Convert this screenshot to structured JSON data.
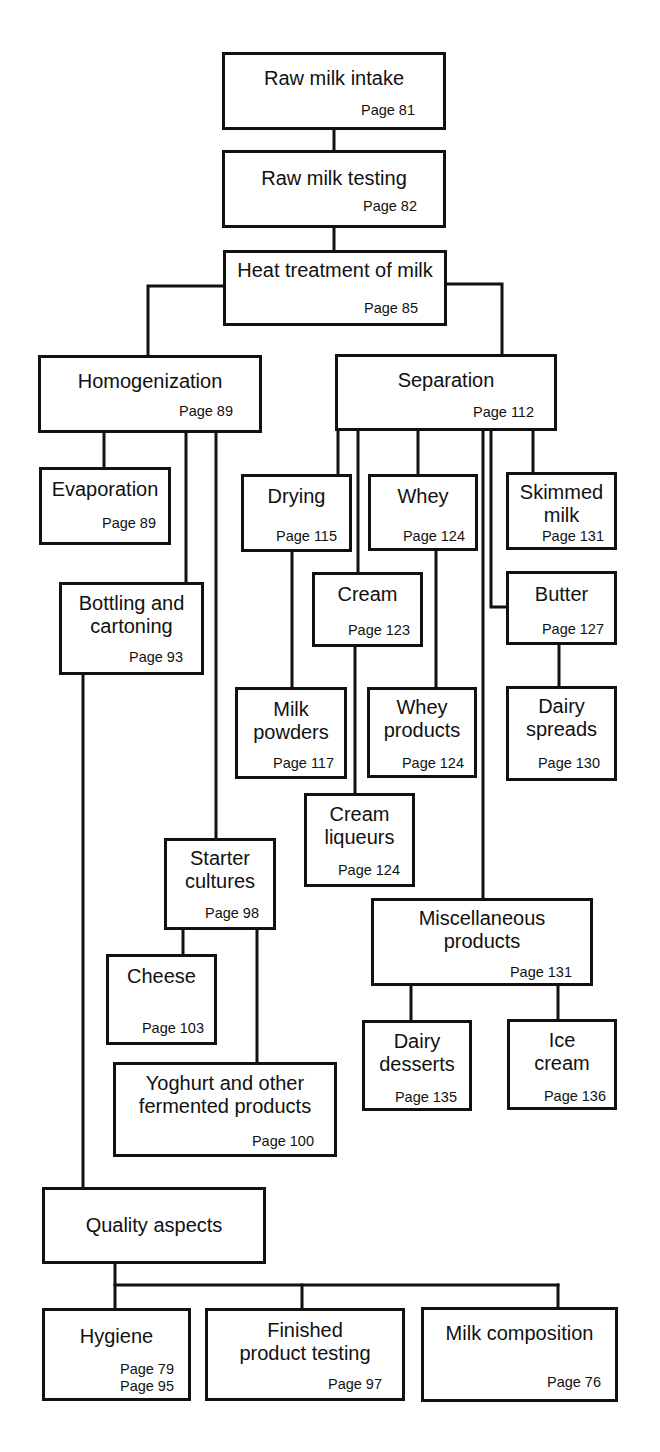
{
  "diagram": {
    "type": "flowchart",
    "line_color": "#111111",
    "background": "#ffffff",
    "nodes": [
      {
        "id": "raw_milk_intake",
        "title": "Raw milk intake",
        "page": "Page 81"
      },
      {
        "id": "raw_milk_testing",
        "title": "Raw milk testing",
        "page": "Page 82"
      },
      {
        "id": "heat_treatment",
        "title": "Heat treatment of milk",
        "page": "Page 85"
      },
      {
        "id": "homogenization",
        "title": "Homogenization",
        "page": "Page 89"
      },
      {
        "id": "separation",
        "title": "Separation",
        "page": "Page 112"
      },
      {
        "id": "evaporation",
        "title": "Evaporation",
        "page": "Page 89"
      },
      {
        "id": "drying",
        "title": "Drying",
        "page": "Page 115"
      },
      {
        "id": "whey",
        "title": "Whey",
        "page": "Page 124"
      },
      {
        "id": "skimmed_milk",
        "title": "Skimmed\nmilk",
        "page": "Page 131"
      },
      {
        "id": "bottling",
        "title": "Bottling and\ncartoning",
        "page": "Page 93"
      },
      {
        "id": "cream",
        "title": "Cream",
        "page": "Page 123"
      },
      {
        "id": "butter",
        "title": "Butter",
        "page": "Page 127"
      },
      {
        "id": "milk_powders",
        "title": "Milk\npowders",
        "page": "Page 117"
      },
      {
        "id": "whey_products",
        "title": "Whey\nproducts",
        "page": "Page 124"
      },
      {
        "id": "dairy_spreads",
        "title": "Dairy\nspreads",
        "page": "Page 130"
      },
      {
        "id": "cream_liqueurs",
        "title": "Cream\nliqueurs",
        "page": "Page 124"
      },
      {
        "id": "starter_cultures",
        "title": "Starter\ncultures",
        "page": "Page 98"
      },
      {
        "id": "misc_products",
        "title": "Miscellaneous\nproducts",
        "page": "Page 131"
      },
      {
        "id": "cheese",
        "title": "Cheese",
        "page": "Page 103"
      },
      {
        "id": "dairy_desserts",
        "title": "Dairy\ndesserts",
        "page": "Page 135"
      },
      {
        "id": "ice_cream",
        "title": "Ice\ncream",
        "page": "Page 136"
      },
      {
        "id": "yoghurt",
        "title": "Yoghurt and other\nfermented products",
        "page": "Page 100"
      },
      {
        "id": "quality_aspects",
        "title": "Quality aspects",
        "page": ""
      },
      {
        "id": "hygiene",
        "title": "Hygiene",
        "page": "Page 79\nPage 95"
      },
      {
        "id": "finished_testing",
        "title": "Finished\nproduct testing",
        "page": "Page 97"
      },
      {
        "id": "milk_composition",
        "title": "Milk composition",
        "page": "Page 76"
      }
    ],
    "edges": [
      [
        "raw_milk_intake",
        "raw_milk_testing"
      ],
      [
        "raw_milk_testing",
        "heat_treatment"
      ],
      [
        "heat_treatment",
        "homogenization"
      ],
      [
        "heat_treatment",
        "separation"
      ],
      [
        "homogenization",
        "evaporation"
      ],
      [
        "homogenization",
        "bottling"
      ],
      [
        "homogenization",
        "starter_cultures"
      ],
      [
        "separation",
        "drying"
      ],
      [
        "separation",
        "cream"
      ],
      [
        "separation",
        "whey"
      ],
      [
        "separation",
        "misc_products"
      ],
      [
        "separation",
        "butter"
      ],
      [
        "separation",
        "skimmed_milk"
      ],
      [
        "drying",
        "milk_powders"
      ],
      [
        "whey",
        "whey_products"
      ],
      [
        "cream",
        "cream_liqueurs"
      ],
      [
        "butter",
        "dairy_spreads"
      ],
      [
        "starter_cultures",
        "cheese"
      ],
      [
        "starter_cultures",
        "yoghurt"
      ],
      [
        "misc_products",
        "dairy_desserts"
      ],
      [
        "misc_products",
        "ice_cream"
      ],
      [
        "bottling",
        "quality_aspects"
      ],
      [
        "quality_aspects",
        "hygiene"
      ],
      [
        "quality_aspects",
        "finished_testing"
      ],
      [
        "quality_aspects",
        "milk_composition"
      ]
    ]
  }
}
